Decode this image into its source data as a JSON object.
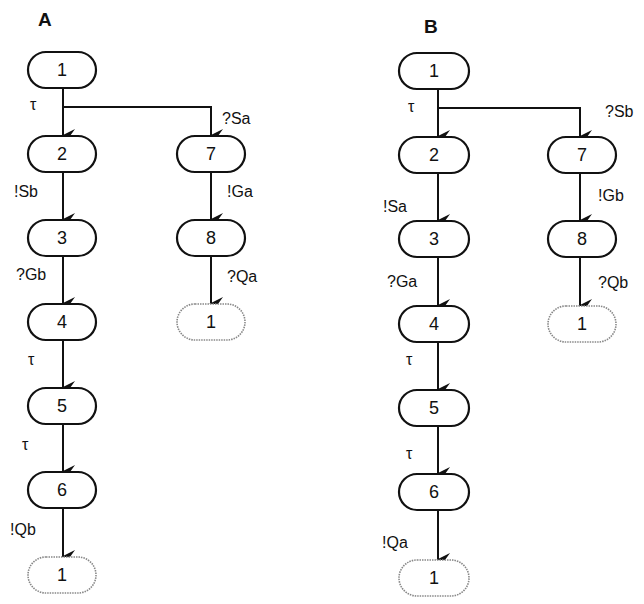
{
  "panels": [
    {
      "title": "A",
      "nodes": {
        "n1": "1",
        "n2": "2",
        "n3": "3",
        "n4": "4",
        "n5": "5",
        "n6": "6",
        "n1end": "1",
        "n7": "7",
        "n8": "8",
        "n1end2": "1"
      },
      "edges": {
        "e1_2": "τ",
        "e1_7": "?Sa",
        "e2_3": "!Sb",
        "e3_4": "?Gb",
        "e4_5": "τ",
        "e5_6": "τ",
        "e6_1": "!Qb",
        "e7_8": "!Ga",
        "e8_1": "?Qa"
      }
    },
    {
      "title": "B",
      "nodes": {
        "n1": "1",
        "n2": "2",
        "n3": "3",
        "n4": "4",
        "n5": "5",
        "n6": "6",
        "n1end": "1",
        "n7": "7",
        "n8": "8",
        "n1end2": "1"
      },
      "edges": {
        "e1_2": "τ",
        "e1_7": "?Sb",
        "e2_3": "!Sa",
        "e3_4": "?Ga",
        "e4_5": "τ",
        "e5_6": "τ",
        "e6_1": "!Qa",
        "e7_8": "!Gb",
        "e8_1": "?Qb"
      }
    }
  ],
  "colors": {
    "stroke": "#111111",
    "ghost_stroke": "#888888",
    "background": "#ffffff"
  }
}
